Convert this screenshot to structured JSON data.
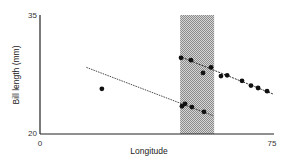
{
  "chart_data": {
    "type": "scatter",
    "title": "",
    "xlabel": "Longitude",
    "ylabel": "Bill length (mm)",
    "xlim": [
      0,
      75
    ],
    "ylim": [
      20,
      35
    ],
    "x_ticks": [
      0,
      75
    ],
    "y_ticks": [
      20,
      35
    ],
    "grid": false,
    "legend": null,
    "shaded_region": {
      "x_start": 45.3,
      "x_end": 56.3,
      "fill": "hatched-grey"
    },
    "series": [
      {
        "name": "isolated point",
        "points": [
          [
            20,
            25.7
          ]
        ]
      },
      {
        "name": "upper group",
        "points": [
          [
            45.6,
            29.6
          ],
          [
            48.8,
            29.3
          ],
          [
            52.7,
            27.7
          ],
          [
            55.3,
            28.4
          ],
          [
            58.5,
            27.3
          ],
          [
            60.5,
            27.4
          ],
          [
            65.3,
            26.7
          ],
          [
            68.2,
            26.1
          ],
          [
            70.5,
            25.8
          ],
          [
            73.4,
            25.4
          ]
        ]
      },
      {
        "name": "lower group",
        "points": [
          [
            45.9,
            23.5
          ],
          [
            46.9,
            23.8
          ],
          [
            49.1,
            23.4
          ],
          [
            53.0,
            22.8
          ]
        ]
      }
    ],
    "trend_lines": [
      {
        "name": "upper trend",
        "style": "dotted-then-solid",
        "from": [
          45,
          29.8
        ],
        "to": [
          75.6,
          25.0
        ]
      },
      {
        "name": "lower trend",
        "style": "dotted-then-solid",
        "from": [
          15,
          28.4
        ],
        "to": [
          56,
          22.3
        ]
      }
    ]
  },
  "labels": {
    "ylabel": "Bill length (mm)",
    "xlabel": "Longitude",
    "y_top": "35",
    "y_bottom": "20",
    "x_left": "0",
    "x_right": "75"
  }
}
